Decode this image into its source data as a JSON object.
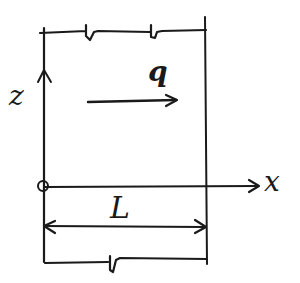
{
  "diagram": {
    "title": "",
    "labels": {
      "z_axis": "z",
      "x_axis": "x",
      "load": "q",
      "length": "L"
    },
    "elements": {
      "z_axis": {
        "from": [
          43,
          190
        ],
        "to": [
          43,
          30
        ],
        "arrowhead_at": [
          43,
          72
        ]
      },
      "x_axis": {
        "from": [
          43,
          187
        ],
        "to": [
          258,
          187
        ],
        "arrowhead": "right"
      },
      "origin_marker": {
        "center": [
          43,
          187
        ],
        "radius": 5
      },
      "right_boundary": {
        "x": 207,
        "y_from": 17,
        "y_to": 264
      },
      "top_boundary": {
        "y": 32,
        "breaks_at_x": [
          88,
          155
        ]
      },
      "bottom_boundary": {
        "y": 262,
        "breaks_at_x": [
          111
        ]
      },
      "load_arrow": {
        "from": [
          88,
          101
        ],
        "to": [
          178,
          101
        ],
        "direction": "right"
      },
      "length_dimension": {
        "from": [
          43,
          226
        ],
        "to": [
          207,
          226
        ],
        "double_arrow": true
      }
    },
    "colors": {
      "ink": "#1a1a1a",
      "background": "#ffffff"
    }
  }
}
